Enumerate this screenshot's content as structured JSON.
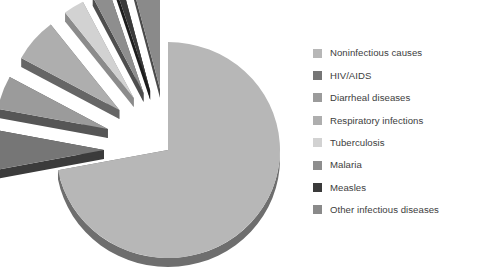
{
  "chart_data": {
    "type": "pie",
    "title": "",
    "subtitle": "",
    "xlabel": "",
    "ylabel": "",
    "legend_position": "right",
    "grid": false,
    "exploded": true,
    "three_d": true,
    "start_angle_deg": 90,
    "direction": "clockwise",
    "categories": [
      "Noninfectious causes",
      "HIV/AIDS",
      "Diarrheal diseases",
      "Respiratory infections",
      "Tuberculosis",
      "Malaria",
      "Measles",
      "Other infectious diseases"
    ],
    "values": [
      72,
      6,
      5,
      6.5,
      3,
      2.5,
      1,
      4
    ],
    "colors": [
      "#b7b7b7",
      "#767676",
      "#9b9b9b",
      "#aeaeae",
      "#d2d2d2",
      "#8e8e8e",
      "#3a3a3a",
      "#8a8a8a"
    ],
    "edge_colors": [
      "#6e6e6e",
      "#3b3b3b",
      "#565656",
      "#666666",
      "#8b8b8b",
      "#4e4e4e",
      "#1d1d1d",
      "#4b4b4b"
    ],
    "slices": [
      {
        "label": "Noninfectious causes",
        "value": 72,
        "color": "#b7b7b7",
        "edge": "#6e6e6e",
        "exploded": false
      },
      {
        "label": "HIV/AIDS",
        "value": 6,
        "color": "#767676",
        "edge": "#3b3b3b",
        "exploded": true
      },
      {
        "label": "Diarrheal diseases",
        "value": 5,
        "color": "#9b9b9b",
        "edge": "#565656",
        "exploded": true
      },
      {
        "label": "Respiratory infections",
        "value": 6.5,
        "color": "#aeaeae",
        "edge": "#666666",
        "exploded": true
      },
      {
        "label": "Tuberculosis",
        "value": 3,
        "color": "#d2d2d2",
        "edge": "#8b8b8b",
        "exploded": true
      },
      {
        "label": "Malaria",
        "value": 2.5,
        "color": "#8e8e8e",
        "edge": "#4e4e4e",
        "exploded": true
      },
      {
        "label": "Measles",
        "value": 1,
        "color": "#3a3a3a",
        "edge": "#1d1d1d",
        "exploded": true
      },
      {
        "label": "Other infectious diseases",
        "value": 4,
        "color": "#8a8a8a",
        "edge": "#4b4b4b",
        "exploded": true
      }
    ]
  },
  "legend": {
    "items": [
      {
        "label": "Noninfectious causes",
        "color": "#b7b7b7"
      },
      {
        "label": "HIV/AIDS",
        "color": "#767676"
      },
      {
        "label": "Diarrheal diseases",
        "color": "#9b9b9b"
      },
      {
        "label": "Respiratory infections",
        "color": "#aeaeae"
      },
      {
        "label": "Tuberculosis",
        "color": "#d2d2d2"
      },
      {
        "label": "Malaria",
        "color": "#8e8e8e"
      },
      {
        "label": "Measles",
        "color": "#3a3a3a"
      },
      {
        "label": "Other infectious diseases",
        "color": "#8a8a8a"
      }
    ]
  }
}
